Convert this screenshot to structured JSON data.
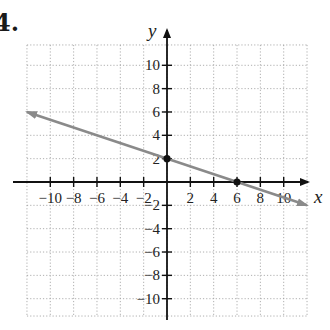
{
  "problem": {
    "number_label": "4."
  },
  "chart_data": {
    "type": "line",
    "title": "",
    "xlabel": "x",
    "ylabel": "y",
    "xlim": [
      -12,
      12
    ],
    "ylim": [
      -12,
      12
    ],
    "grid": true,
    "grid_style": "dotted",
    "grid_step": 2,
    "x_ticks": [
      -10,
      -8,
      -6,
      -4,
      -2,
      2,
      4,
      6,
      8,
      10
    ],
    "y_ticks": [
      10,
      8,
      6,
      4,
      2,
      -2,
      -4,
      -6,
      -8,
      -10
    ],
    "x_tick_labels": [
      "−10",
      "−8",
      "−6",
      "−4",
      "−2",
      "2",
      "4",
      "6",
      "8",
      "10"
    ],
    "y_tick_labels": [
      "10",
      "8",
      "6",
      "4",
      "2",
      "−2",
      "−4",
      "−6",
      "−8",
      "−10"
    ],
    "series": [
      {
        "name": "line",
        "equation": "y = -x/3 + 2",
        "slope": -0.3333,
        "intercept": 2,
        "x": [
          -12,
          12
        ],
        "y": [
          6,
          -2
        ],
        "arrows": "both",
        "color": "#8a8a8a"
      }
    ],
    "points": [
      {
        "label": "y-intercept",
        "x": 0,
        "y": 2,
        "color": "#111111"
      },
      {
        "label": "x-intercept",
        "x": 6,
        "y": 0,
        "color": "#111111"
      }
    ]
  },
  "colors": {
    "axis": "#111111",
    "grid": "#9a9a9a",
    "line": "#8a8a8a",
    "point": "#111111"
  }
}
